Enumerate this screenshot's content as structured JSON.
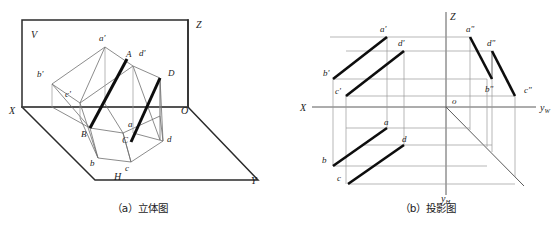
{
  "figure_a": {
    "caption": "（a）立体图",
    "plane_labels": [
      {
        "name": "V",
        "text": "V",
        "x": 31,
        "y": 35
      },
      {
        "name": "H",
        "text": "H",
        "x": 116,
        "y": 178
      }
    ],
    "axis_labels": [
      {
        "name": "Z",
        "text": "Z",
        "x": 196,
        "y": 26
      },
      {
        "name": "X",
        "text": "X",
        "x": 11,
        "y": 112
      },
      {
        "name": "O",
        "text": "O",
        "x": 183,
        "y": 112
      },
      {
        "name": "Y",
        "text": "Y",
        "x": 252,
        "y": 182
      }
    ],
    "point_labels": [
      {
        "name": "a-prime",
        "text": "a'",
        "x": 101,
        "y": 37
      },
      {
        "name": "A",
        "text": "A",
        "x": 128,
        "y": 55
      },
      {
        "name": "d-prime",
        "text": "d'",
        "x": 141,
        "y": 54
      },
      {
        "name": "b-prime",
        "text": "b'",
        "x": 39,
        "y": 75
      },
      {
        "name": "c-prime",
        "text": "c'",
        "x": 67,
        "y": 94
      },
      {
        "name": "D",
        "text": "D",
        "x": 170,
        "y": 74
      },
      {
        "name": "B",
        "text": "B",
        "x": 84,
        "y": 134
      },
      {
        "name": "a",
        "text": "a",
        "x": 129,
        "y": 125
      },
      {
        "name": "C",
        "text": "C",
        "x": 124,
        "y": 140
      },
      {
        "name": "d",
        "text": "d",
        "x": 168,
        "y": 140
      },
      {
        "name": "b",
        "text": "b",
        "x": 92,
        "y": 163
      },
      {
        "name": "c",
        "text": "c",
        "x": 127,
        "y": 168
      }
    ]
  },
  "figure_b": {
    "caption": "（b）投影图",
    "axis_labels": [
      {
        "name": "Z",
        "text": "Z",
        "x": 450,
        "y": 18
      },
      {
        "name": "X",
        "text": "X",
        "x": 303,
        "y": 109
      },
      {
        "name": "O",
        "text": "o",
        "x": 453,
        "y": 103
      },
      {
        "name": "yW",
        "text": "y",
        "sub": "W",
        "x": 542,
        "y": 110
      },
      {
        "name": "yH",
        "text": "y",
        "sub": "H",
        "x": 443,
        "y": 200
      }
    ],
    "point_labels": [
      {
        "name": "a-prime",
        "text": "a'",
        "x": 382,
        "y": 30
      },
      {
        "name": "a-double",
        "text": "a\"",
        "x": 468,
        "y": 30
      },
      {
        "name": "d-prime",
        "text": "d'",
        "x": 400,
        "y": 44
      },
      {
        "name": "d-double",
        "text": "d\"",
        "x": 489,
        "y": 44
      },
      {
        "name": "b-prime",
        "text": "b'",
        "x": 326,
        "y": 73
      },
      {
        "name": "b-double",
        "text": "b\"",
        "x": 487,
        "y": 90
      },
      {
        "name": "c-prime",
        "text": "c'",
        "x": 337,
        "y": 90
      },
      {
        "name": "c-double",
        "text": "c\"",
        "x": 527,
        "y": 90
      },
      {
        "name": "a",
        "text": "a",
        "x": 386,
        "y": 122
      },
      {
        "name": "d",
        "text": "d",
        "x": 404,
        "y": 140
      },
      {
        "name": "b",
        "text": "b",
        "x": 325,
        "y": 160
      },
      {
        "name": "c",
        "text": "c",
        "x": 340,
        "y": 178
      }
    ]
  },
  "colors": {
    "heavy_line": "#0d0d0d",
    "plane_edge": "#2b2b2b",
    "thin_line": "#6e6e6e",
    "projection_line": "#9a9a9a",
    "background": "#ffffff"
  },
  "geometry_note": "Descriptive geometry: two skew segments AB and CD shown in pictorial (a) and three-view projection (b)."
}
